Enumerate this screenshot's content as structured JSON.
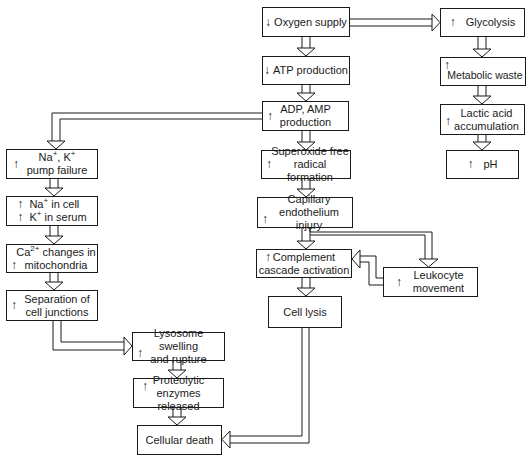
{
  "diagram": {
    "title": "",
    "nodes": {
      "oxygen": {
        "indicator": "↓",
        "text": "Oxygen supply"
      },
      "atp": {
        "indicator": "↓",
        "text": "ATP production"
      },
      "adp": {
        "indicator": "↑",
        "line1": "ADP, AMP",
        "line2": "production"
      },
      "superoxide": {
        "indicator": "↑",
        "line1": "Superoxide free",
        "line2": "radical formation"
      },
      "capillary": {
        "indicator": "↑",
        "line1": "Capillary",
        "line2": "endothelium injury"
      },
      "complement": {
        "indicator": "↑",
        "line1": "Complement",
        "line2": "cascade activation"
      },
      "leukocyte": {
        "indicator": "↑",
        "line1": "Leukocyte",
        "line2": "movement"
      },
      "lysis": {
        "text": "Cell lysis"
      },
      "glycolysis": {
        "indicator": "↑",
        "text": "Glycolysis"
      },
      "metabolic": {
        "indicator": "↑",
        "text": "Metabolic waste"
      },
      "lactic": {
        "indicator": "↑",
        "line1": "Lactic acid",
        "line2": "accumulation"
      },
      "ph": {
        "indicator": "↑",
        "text": "pH"
      },
      "pump": {
        "indicator": "↑",
        "line1_a": "Na",
        "line1_sup_a": "+",
        "line1_b": ", K",
        "line1_sup_b": "+",
        "line2": "pump failure"
      },
      "ions": {
        "indicator1": "↑",
        "line1_a": "Na",
        "line1_sup": "+",
        "line1_b": " in cell",
        "indicator2": "↑",
        "line2_a": "K",
        "line2_sup": "+",
        "line2_b": " in serum"
      },
      "calcium": {
        "indicator": "↑",
        "line1_a": "Ca",
        "line1_sup": "2+",
        "line1_b": " changes in",
        "line2": "mitochondria"
      },
      "separation": {
        "indicator": "↑",
        "line1": "Separation of",
        "line2": "cell junctions"
      },
      "lysosome": {
        "indicator": "↑",
        "line1": "Lysosome swelling",
        "line2": "and rupture"
      },
      "proteolytic": {
        "indicator": "↑",
        "line1": "Proteolytic",
        "line2": "enzymes released"
      },
      "death": {
        "text": "Cellular death"
      }
    },
    "edges": [
      [
        "oxygen",
        "atp"
      ],
      [
        "oxygen",
        "glycolysis"
      ],
      [
        "atp",
        "adp"
      ],
      [
        "adp",
        "superoxide"
      ],
      [
        "adp",
        "pump"
      ],
      [
        "superoxide",
        "capillary"
      ],
      [
        "capillary",
        "complement"
      ],
      [
        "capillary",
        "leukocyte"
      ],
      [
        "leukocyte",
        "complement"
      ],
      [
        "complement",
        "lysis"
      ],
      [
        "lysis",
        "death"
      ],
      [
        "glycolysis",
        "metabolic"
      ],
      [
        "metabolic",
        "lactic"
      ],
      [
        "lactic",
        "ph"
      ],
      [
        "pump",
        "ions"
      ],
      [
        "ions",
        "calcium"
      ],
      [
        "calcium",
        "separation"
      ],
      [
        "separation",
        "lysosome"
      ],
      [
        "lysosome",
        "proteolytic"
      ],
      [
        "proteolytic",
        "death"
      ]
    ],
    "colors": {
      "stroke": "#1a1a1a",
      "background": "#ffffff"
    }
  }
}
